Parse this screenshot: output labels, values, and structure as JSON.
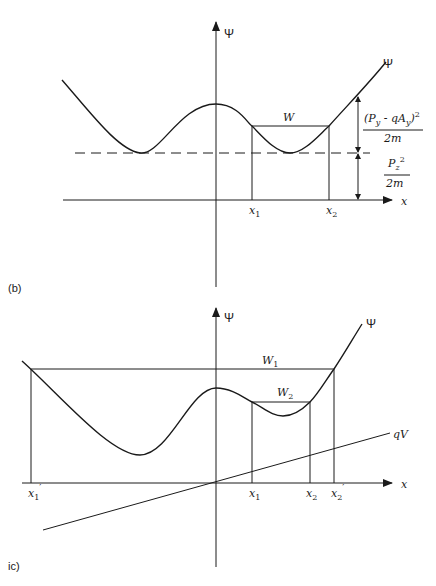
{
  "panels": {
    "b": {
      "panel_label": "(b)",
      "y_axis_label": "Ψ",
      "x_axis_label": "x",
      "curve_label": "Ψ",
      "energy_level_label": "W",
      "turning_points": [
        "x",
        "x"
      ],
      "turning_point_subscripts": [
        "1",
        "2"
      ],
      "annotation_top": {
        "numerator": "(P",
        "sub1": "y",
        "mid": " - qA",
        "sub2": "y",
        "close": ")",
        "sup": "2",
        "denominator": "2m"
      },
      "annotation_bottom": {
        "numerator": "P",
        "sub": "z",
        "sup": "2",
        "denominator": "2m"
      }
    },
    "c": {
      "panel_label": "ic)",
      "y_axis_label": "Ψ",
      "x_axis_label": "x",
      "curve_label": "Ψ",
      "potential_label": "qV",
      "energy_levels": [
        {
          "label": "W",
          "sub": "1"
        },
        {
          "label": "W",
          "sub": "2"
        }
      ],
      "turning_points": [
        {
          "label": "x",
          "sub": "1",
          "prime": "′"
        },
        {
          "label": "x",
          "sub": "1",
          "prime": ""
        },
        {
          "label": "x",
          "sub": "2",
          "prime": ""
        },
        {
          "label": "x",
          "sub": "2",
          "prime": "′"
        }
      ]
    }
  },
  "colors": {
    "ink": "#1a1a1a",
    "background": "#ffffff"
  }
}
